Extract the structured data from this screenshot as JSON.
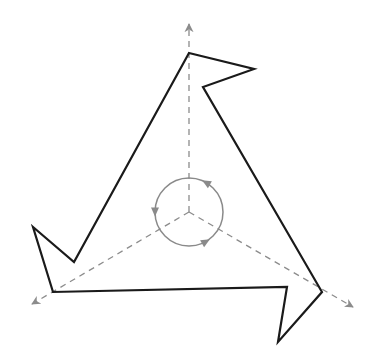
{
  "diagram": {
    "type": "rotational-symmetry-figure",
    "colors": {
      "background": "#ffffff",
      "outline": "#1a1a1a",
      "axis": "#8c8c8c",
      "rotation_arrow": "#8a8a8a"
    },
    "center": [
      189,
      212
    ],
    "outline_points": [
      [
        189,
        53
      ],
      [
        254,
        69
      ],
      [
        203,
        87
      ],
      [
        322,
        292
      ],
      [
        278,
        342
      ],
      [
        287,
        287
      ],
      [
        53,
        292
      ],
      [
        33,
        227
      ],
      [
        74,
        262
      ]
    ],
    "axes": [
      {
        "from": [
          189,
          212
        ],
        "to": [
          189,
          24
        ],
        "name": "axis-up"
      },
      {
        "from": [
          189,
          212
        ],
        "to": [
          32,
          304
        ],
        "name": "axis-lower-left"
      },
      {
        "from": [
          189,
          212
        ],
        "to": [
          353,
          307
        ],
        "name": "axis-lower-right"
      }
    ],
    "rotation_circle": {
      "radius": 34,
      "direction": "counter-clockwise",
      "arrowheads_deg": [
        60,
        180,
        300
      ]
    }
  }
}
